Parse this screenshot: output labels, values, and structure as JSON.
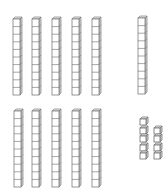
{
  "diagram": {
    "colors": {
      "stroke": "#6b6b6b",
      "face": "#ffffff",
      "side": "#d4d4d4",
      "top": "#ececec"
    },
    "rods": [
      {
        "x": 13,
        "y": 17,
        "units": 10
      },
      {
        "x": 32,
        "y": 17,
        "units": 10
      },
      {
        "x": 52,
        "y": 17,
        "units": 10
      },
      {
        "x": 72,
        "y": 17,
        "units": 10
      },
      {
        "x": 92,
        "y": 17,
        "units": 10
      },
      {
        "x": 138,
        "y": 16,
        "units": 10
      },
      {
        "x": 14,
        "y": 109,
        "units": 10
      },
      {
        "x": 32,
        "y": 109,
        "units": 10
      },
      {
        "x": 52,
        "y": 109,
        "units": 10
      },
      {
        "x": 72,
        "y": 109,
        "units": 10
      },
      {
        "x": 92,
        "y": 109,
        "units": 10
      }
    ],
    "units": [
      {
        "x": 140,
        "y": 117
      },
      {
        "x": 140,
        "y": 126
      },
      {
        "x": 154,
        "y": 126
      },
      {
        "x": 140,
        "y": 134
      },
      {
        "x": 154,
        "y": 134
      },
      {
        "x": 140,
        "y": 143
      },
      {
        "x": 154,
        "y": 143
      },
      {
        "x": 140,
        "y": 151
      },
      {
        "x": 154,
        "y": 151
      }
    ],
    "counts": {
      "tens_rods": 11,
      "unit_cubes": 9
    }
  }
}
